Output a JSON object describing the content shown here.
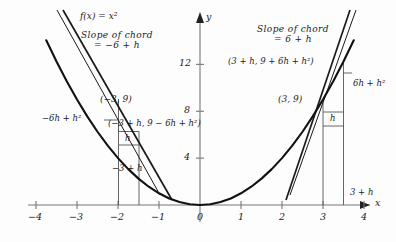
{
  "figure": {
    "title_label": "f(x) = x²",
    "background": "#fdfdfd",
    "ink": "#1a1a1a",
    "axis_color": "#777777"
  },
  "axes": {
    "x_axis_name": "x",
    "y_axis_name": "y",
    "x_ticks": [
      {
        "value": -4,
        "label": "−4"
      },
      {
        "value": -3,
        "label": "−3"
      },
      {
        "value": -2,
        "label": "−2"
      },
      {
        "value": -1,
        "label": "−1"
      },
      {
        "value": 0,
        "label": "0"
      },
      {
        "value": 1,
        "label": "1"
      },
      {
        "value": 2,
        "label": "2"
      },
      {
        "value": 3,
        "label": "3"
      },
      {
        "value": 4,
        "label": "4"
      }
    ],
    "y_ticks": [
      {
        "value": 4,
        "label": "4"
      },
      {
        "value": 8,
        "label": "8"
      },
      {
        "value": 12,
        "label": "12"
      }
    ],
    "xlim": [
      -4.55,
      4.55
    ],
    "ylim": [
      -0.9,
      15.5
    ]
  },
  "left_construction": {
    "slope_of_chord_line1": "Slope of chord",
    "slope_of_chord_line2": "= −6 + h",
    "point_label": "(−3, 9)",
    "secant_point_label": "(−3 + h, 9 − 6h + h²)",
    "rise_label": "−6h + h²",
    "run_label": "h",
    "base_label": "−3 + h"
  },
  "right_construction": {
    "slope_of_chord_line1": "Slope of chord",
    "slope_of_chord_line2": "= 6 + h",
    "point_label": "(3, 9)",
    "secant_point_label": "(3 + h, 9 + 6h + h²)",
    "rise_label": "6h + h²",
    "run_label": "h",
    "base_label": "3 + h"
  },
  "chart_data": {
    "type": "line",
    "title": "f(x) = x²",
    "xlabel": "x",
    "ylabel": "y",
    "xlim": [
      -4.55,
      4.55
    ],
    "ylim": [
      -0.9,
      15.5
    ],
    "grid": false,
    "legend": "none",
    "xticks": [
      -4,
      -3,
      -2,
      -1,
      0,
      1,
      2,
      3,
      4
    ],
    "yticks": [
      4,
      8,
      12
    ],
    "series": [
      {
        "name": "f(x) = x^2",
        "type": "curve",
        "x": [
          -3.75,
          -3.5,
          -3.25,
          -3,
          -2.75,
          -2.5,
          -2.25,
          -2,
          -1.75,
          -1.5,
          -1.25,
          -1,
          -0.75,
          -0.5,
          -0.25,
          0,
          0.25,
          0.5,
          0.75,
          1,
          1.25,
          1.5,
          1.75,
          2,
          2.25,
          2.5,
          2.75,
          3,
          3.25,
          3.5,
          3.75
        ],
        "y": [
          14.06,
          12.25,
          10.56,
          9,
          7.56,
          6.25,
          5.06,
          4,
          3.06,
          2.25,
          1.56,
          1,
          0.56,
          0.25,
          0.06,
          0,
          0.06,
          0.25,
          0.56,
          1,
          1.56,
          2.25,
          3.06,
          4,
          5.06,
          6.25,
          7.56,
          9,
          10.56,
          12.25,
          14.06
        ]
      },
      {
        "name": "secant-left",
        "type": "line",
        "through": [
          [
            -3,
            9
          ],
          [
            -2.5,
            6.25
          ]
        ],
        "slope": -5.5,
        "slope_expression": "−6 + h"
      },
      {
        "name": "tangent-left",
        "type": "line",
        "through": [
          [
            -3,
            9
          ]
        ],
        "slope": -6,
        "slope_expression": "−6"
      },
      {
        "name": "secant-right",
        "type": "line",
        "through": [
          [
            3,
            9
          ],
          [
            3.5,
            12.25
          ]
        ],
        "slope": 6.5,
        "slope_expression": "6 + h"
      },
      {
        "name": "tangent-right",
        "type": "line",
        "through": [
          [
            3,
            9
          ]
        ],
        "slope": 6,
        "slope_expression": "6"
      }
    ],
    "annotations": [
      {
        "text": "f(x) = x²",
        "x": -2.05,
        "y": 14.6
      },
      {
        "text": "Slope of chord = −6 + h",
        "x": -1.45,
        "y": 12.9
      },
      {
        "text": "Slope of chord = 6 + h",
        "x": 2.35,
        "y": 13.2
      },
      {
        "text": "(−3, 9)",
        "x": -2.4,
        "y": 9.6
      },
      {
        "text": "(−3 + h, 9 − 6h + h²)",
        "x": -2.1,
        "y": 7.6
      },
      {
        "text": "−6h + h²",
        "x": -4.3,
        "y": 7.9
      },
      {
        "text": "h",
        "x": -2.78,
        "y": 6.2
      },
      {
        "text": "−3 + h",
        "x": -2.35,
        "y": 1.6
      },
      {
        "text": "(3 + h, 9 + 6h + h²)",
        "x": 1.25,
        "y": 11.4
      },
      {
        "text": "(3, 9)",
        "x": 2.05,
        "y": 8.9
      },
      {
        "text": "6h + h²",
        "x": 3.65,
        "y": 10.1
      },
      {
        "text": "h",
        "x": 3.2,
        "y": 8.1
      },
      {
        "text": "3 + h",
        "x": 3.62,
        "y": 2.0
      }
    ],
    "marked_points": [
      {
        "label": "(−3, 9)",
        "x": -3,
        "y": 9
      },
      {
        "label": "(−3 + h, 9 − 6h + h²)",
        "x": -2.5,
        "y": 6.25
      },
      {
        "label": "(3, 9)",
        "x": 3,
        "y": 9
      },
      {
        "label": "(3 + h, 9 + 6h + h²)",
        "x": 3.5,
        "y": 12.25
      }
    ]
  }
}
